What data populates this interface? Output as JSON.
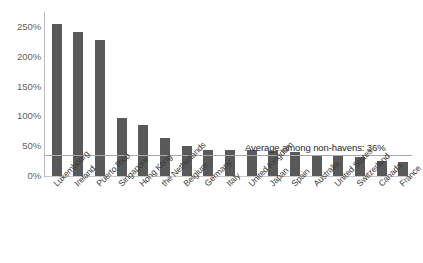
{
  "chart_data": {
    "type": "bar",
    "title": "",
    "subtitle": "",
    "xlabel": "",
    "ylabel": "",
    "ylim": [
      0,
      275
    ],
    "grid": false,
    "legend_position": "none",
    "y_ticks": [
      "0%",
      "50%",
      "100%",
      "150%",
      "200%",
      "250%"
    ],
    "y_tick_values": [
      0,
      50,
      100,
      150,
      200,
      250
    ],
    "categories": [
      "Luxembourg",
      "Ireland",
      "Puerto Rico",
      "Singapore",
      "Hong Kong",
      "the Netherlands",
      "Belgium",
      "Germany",
      "Italy",
      "United Kingdom",
      "Japan",
      "Spain",
      "Australia",
      "United States",
      "Switzerland",
      "Canada",
      "France"
    ],
    "values": [
      255,
      242,
      228,
      98,
      86,
      63,
      51,
      44,
      43,
      43,
      42,
      41,
      36,
      33,
      32,
      25,
      24
    ],
    "bar_color": "#595959",
    "annotations": [
      {
        "text": "Average among non-havens: 36%",
        "value": 36,
        "type": "reference-line",
        "line_color": "#a8a8a8"
      }
    ]
  }
}
